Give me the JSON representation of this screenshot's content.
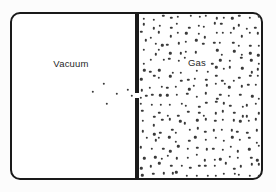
{
  "diagram": {
    "left_label": "Vacuum",
    "right_label": "Gas",
    "colors": {
      "outline": "#1a1a1a",
      "particle": "#3a3a3a",
      "vessel_background": "#ffffff",
      "label_text": "#272727"
    },
    "particles": {
      "dot_diameter_px": 2.4,
      "escaped_left": [
        [
          104,
          84
        ],
        [
          93,
          92
        ],
        [
          117,
          94
        ],
        [
          128,
          90
        ],
        [
          132,
          96
        ],
        [
          107,
          104
        ],
        [
          141,
          98
        ]
      ],
      "right_field": {
        "x0": 144,
        "x1": 258,
        "y0": 17,
        "y1": 175,
        "cols": 14,
        "rows": 19,
        "jitter": 3.2,
        "seed": 20240601,
        "clamp": [
          141,
          259,
          16,
          176
        ],
        "label_exclude": [
          186,
          54,
          208,
          68
        ]
      }
    }
  }
}
